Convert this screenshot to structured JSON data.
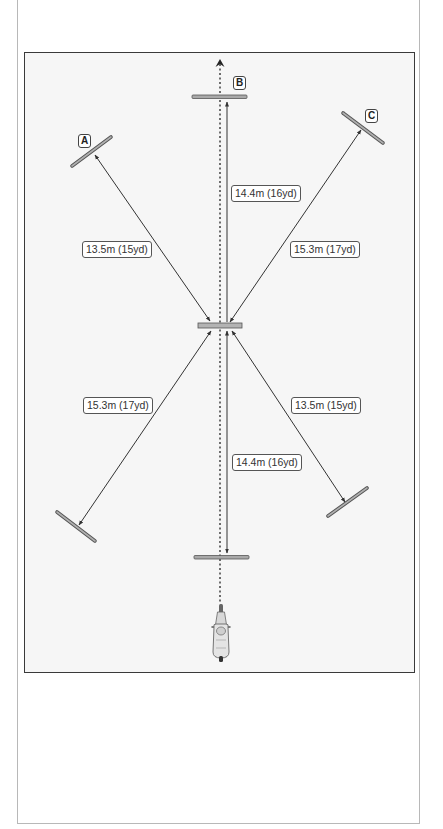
{
  "diagram": {
    "type": "cone-layout",
    "cones": [
      {
        "id": "A",
        "label": "A",
        "position": "upper-left"
      },
      {
        "id": "B",
        "label": "B",
        "position": "top-center"
      },
      {
        "id": "C",
        "label": "C",
        "position": "upper-right"
      }
    ],
    "distances": [
      {
        "id": "center-to-B",
        "label": "14.4m (16yd)"
      },
      {
        "id": "center-to-A",
        "label": "13.5m (15yd)"
      },
      {
        "id": "center-to-C",
        "label": "15.3m (17yd)"
      },
      {
        "id": "center-to-lower-left",
        "label": "15.3m (17yd)"
      },
      {
        "id": "center-to-lower-right",
        "label": "13.5m (15yd)"
      },
      {
        "id": "center-to-bottom",
        "label": "14.4m (16yd)"
      }
    ],
    "colors": {
      "bar_fill": "#a9a9a9",
      "bar_stroke": "#555555",
      "line": "#333333",
      "frame": "#3a3a3a",
      "background": "#f6f6f6"
    }
  }
}
